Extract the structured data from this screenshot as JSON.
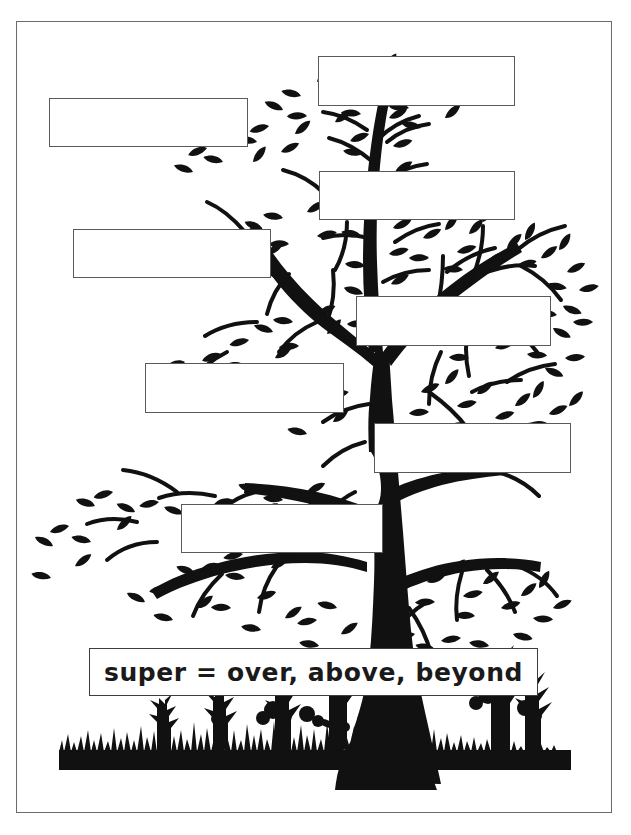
{
  "worksheet": {
    "kind": "word-tree-graphic-organizer",
    "border_color": "#6b6b6b",
    "art_color": "#111111",
    "background_color": "#ffffff"
  },
  "definition": {
    "text": "super = over, above, beyond",
    "prefix": "super",
    "equals": "=",
    "meanings": "over, above, beyond"
  },
  "answer_boxes": [
    {
      "id": "box-1",
      "label": "",
      "placeholder": "",
      "x": 49,
      "y": 98,
      "w": 199,
      "h": 49
    },
    {
      "id": "box-2",
      "label": "",
      "placeholder": "",
      "x": 318,
      "y": 56,
      "w": 197,
      "h": 50
    },
    {
      "id": "box-3",
      "label": "",
      "placeholder": "",
      "x": 319,
      "y": 171,
      "w": 196,
      "h": 49
    },
    {
      "id": "box-4",
      "label": "",
      "placeholder": "",
      "x": 73,
      "y": 229,
      "w": 198,
      "h": 49
    },
    {
      "id": "box-5",
      "label": "",
      "placeholder": "",
      "x": 356,
      "y": 296,
      "w": 195,
      "h": 50
    },
    {
      "id": "box-6",
      "label": "",
      "placeholder": "",
      "x": 145,
      "y": 363,
      "w": 199,
      "h": 50
    },
    {
      "id": "box-7",
      "label": "",
      "placeholder": "",
      "x": 374,
      "y": 423,
      "w": 197,
      "h": 50
    },
    {
      "id": "box-8",
      "label": "",
      "placeholder": "",
      "x": 181,
      "y": 504,
      "w": 202,
      "h": 49
    }
  ]
}
